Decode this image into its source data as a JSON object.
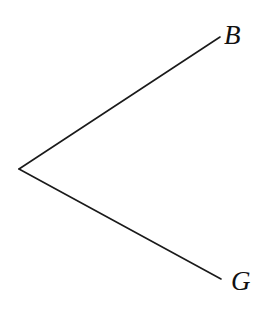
{
  "diagram": {
    "type": "tree",
    "line_color": "#1a1a1a",
    "root": {
      "x": 19,
      "y": 169
    },
    "branches": [
      {
        "label": "B",
        "end": {
          "x": 220,
          "y": 37
        }
      },
      {
        "label": "G",
        "end": {
          "x": 221,
          "y": 279
        }
      }
    ]
  }
}
